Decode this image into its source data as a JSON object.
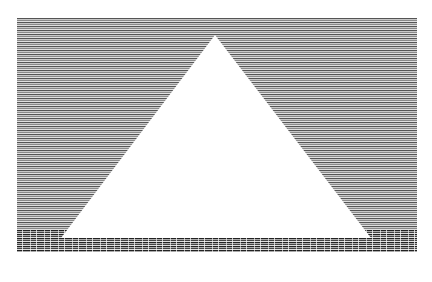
{
  "image": {
    "description": "Monochrome halftone line-screen graphic of a white triangle (pyramid) on horizontally striped background above a dotted textured ground band",
    "colors": {
      "background": "#ffffff",
      "stripe_dark": "#555555",
      "stripe_light": "#c8c8c8",
      "ground_dark": "#222222",
      "triangle": "#ffffff"
    },
    "triangle": {
      "apex": [
        198,
        17
      ],
      "base_left": [
        44,
        220
      ],
      "base_right": [
        354,
        220
      ]
    }
  }
}
